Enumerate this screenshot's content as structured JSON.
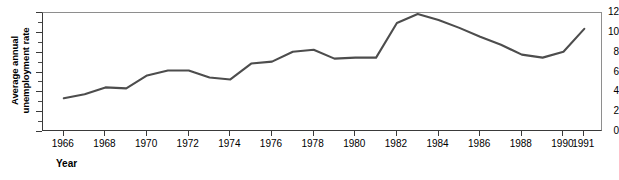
{
  "chart_data": {
    "type": "line",
    "title": "",
    "xlabel": "Year",
    "ylabel": "Average annual\nunemployment rate",
    "x": [
      1966,
      1967,
      1968,
      1969,
      1970,
      1971,
      1972,
      1973,
      1974,
      1975,
      1976,
      1977,
      1978,
      1979,
      1980,
      1981,
      1982,
      1983,
      1984,
      1985,
      1986,
      1987,
      1988,
      1989,
      1990,
      1991
    ],
    "values": [
      3.4,
      3.8,
      4.5,
      4.4,
      5.7,
      6.2,
      6.2,
      5.5,
      5.3,
      6.9,
      7.1,
      8.1,
      8.3,
      7.4,
      7.5,
      7.5,
      11.0,
      11.9,
      11.3,
      10.5,
      9.6,
      8.8,
      7.8,
      7.5,
      8.1,
      10.4
    ],
    "series": [
      {
        "name": "Average annual unemployment rate",
        "values": [
          3.4,
          3.8,
          4.5,
          4.4,
          5.7,
          6.2,
          6.2,
          5.5,
          5.3,
          6.9,
          7.1,
          8.1,
          8.3,
          7.4,
          7.5,
          7.5,
          11.0,
          11.9,
          11.3,
          10.5,
          9.6,
          8.8,
          7.8,
          7.5,
          8.1,
          10.4
        ],
        "color": "#4d4d4d"
      }
    ],
    "xlim": [
      1965.0,
      1991.9
    ],
    "ylim": [
      0,
      12
    ],
    "ytick_labels": [
      "0",
      "2",
      "4",
      "6",
      "8",
      "10",
      "12"
    ],
    "ytick_values": [
      0,
      2,
      4,
      6,
      8,
      10,
      12
    ],
    "yminor_values": [
      1,
      3,
      5,
      7,
      9,
      11
    ],
    "xtick_labels": [
      "1966",
      "1968",
      "1970",
      "1972",
      "1974",
      "1976",
      "1978",
      "1980",
      "1982",
      "1984",
      "1986",
      "1988",
      "1990",
      "1991"
    ],
    "xtick_values": [
      1966,
      1968,
      1970,
      1972,
      1974,
      1976,
      1978,
      1980,
      1982,
      1984,
      1986,
      1988,
      1990,
      1991
    ],
    "grid": false,
    "legend": false,
    "line_color": "#4d4d4d",
    "axis_color": "#3a3a3a",
    "background": "#ffffff"
  }
}
